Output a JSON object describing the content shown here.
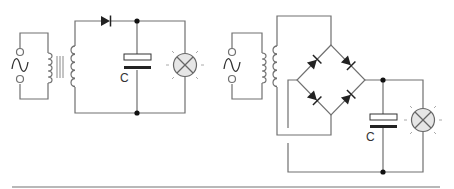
{
  "diagram": {
    "type": "circuit-schematic",
    "colors": {
      "wire": "#707070",
      "component": "#222222",
      "lamp_fill": "#e6e6e6",
      "divider": "#a0a0a0"
    },
    "circuits": [
      {
        "id": "half-wave",
        "components": [
          "ac-source",
          "transformer",
          "diode",
          "capacitor",
          "lamp"
        ],
        "capacitor_label": "C"
      },
      {
        "id": "full-wave-bridge",
        "components": [
          "ac-source",
          "transformer",
          "bridge-rectifier",
          "capacitor",
          "lamp"
        ],
        "capacitor_label": "C"
      }
    ]
  }
}
